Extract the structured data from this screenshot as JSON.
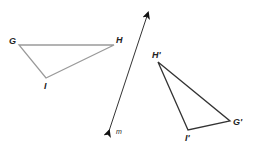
{
  "diagram": {
    "type": "geometric reflection",
    "line": {
      "label": "m",
      "from": [
        109,
        131
      ],
      "to": [
        148,
        13
      ],
      "color": "#222222"
    },
    "original_triangle": {
      "color": "#9a9a9a",
      "vertices": {
        "G": {
          "label": "G",
          "point": [
            19,
            45
          ]
        },
        "H": {
          "label": "H",
          "point": [
            114,
            45
          ]
        },
        "I": {
          "label": "I",
          "point": [
            46,
            78
          ]
        }
      }
    },
    "image_triangle": {
      "color": "#333333",
      "vertices": {
        "H_prime": {
          "label": "H'",
          "point": [
            158,
            62
          ]
        },
        "G_prime": {
          "label": "G'",
          "point": [
            230,
            121
          ]
        },
        "I_prime": {
          "label": "I'",
          "point": [
            188,
            130
          ]
        }
      }
    }
  }
}
